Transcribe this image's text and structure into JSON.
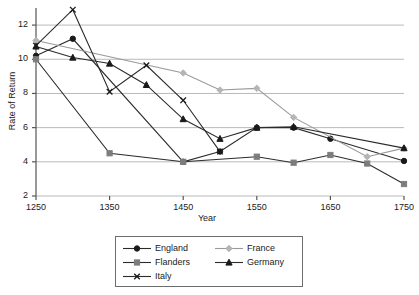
{
  "chart_data": {
    "type": "line",
    "title": "",
    "xlabel": "Year",
    "ylabel": "Rate of Return",
    "x": [
      1250,
      1300,
      1350,
      1400,
      1450,
      1500,
      1550,
      1600,
      1650,
      1700,
      1750
    ],
    "xlim": [
      1250,
      1750
    ],
    "ylim": [
      2,
      13
    ],
    "xticks": [
      1250,
      1350,
      1450,
      1550,
      1650,
      1750
    ],
    "yticks": [
      2,
      4,
      6,
      8,
      10,
      12
    ],
    "grid": "horizontal",
    "legend_position": "bottom-center",
    "series": [
      {
        "name": "England",
        "marker": "circle",
        "color": "#1a1a1a",
        "x": [
          1250,
          1300,
          1450,
          1500,
          1550,
          1600,
          1650,
          1750
        ],
        "values": [
          10.2,
          11.2,
          4.0,
          4.6,
          6.0,
          6.0,
          5.35,
          4.05
        ]
      },
      {
        "name": "France",
        "marker": "diamond",
        "color": "#b5b5b5",
        "x": [
          1250,
          1450,
          1500,
          1550,
          1600,
          1700,
          1750
        ],
        "values": [
          11.1,
          9.2,
          8.2,
          8.3,
          6.6,
          4.3,
          4.8
        ]
      },
      {
        "name": "Flanders",
        "marker": "square",
        "color": "#7d7d7d",
        "x": [
          1250,
          1350,
          1450,
          1550,
          1600,
          1650,
          1700,
          1750
        ],
        "values": [
          10.0,
          4.5,
          4.0,
          4.3,
          3.95,
          4.4,
          3.9,
          2.7
        ]
      },
      {
        "name": "Germany",
        "marker": "triangle",
        "color": "#1a1a1a",
        "x": [
          1250,
          1300,
          1350,
          1400,
          1450,
          1500,
          1550,
          1600,
          1750
        ],
        "values": [
          10.75,
          10.1,
          9.75,
          8.5,
          6.5,
          5.35,
          6.0,
          6.05,
          4.8
        ]
      },
      {
        "name": "Italy",
        "marker": "x",
        "color": "#1a1a1a",
        "x": [
          1250,
          1300,
          1350,
          1400,
          1450,
          1500
        ],
        "values": [
          10.8,
          12.9,
          8.1,
          9.65,
          7.6,
          4.6
        ]
      }
    ]
  },
  "legend": {
    "entries": [
      {
        "label": "England"
      },
      {
        "label": "France"
      },
      {
        "label": "Flanders"
      },
      {
        "label": "Germany"
      },
      {
        "label": "Italy"
      }
    ]
  }
}
